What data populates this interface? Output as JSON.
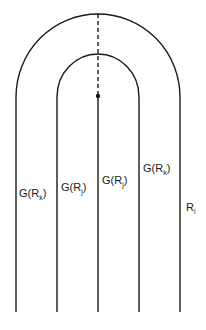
{
  "diagram": {
    "labels": [
      {
        "id": "label-g-rk-left",
        "main": "G(R",
        "sub": "k",
        "close": ")"
      },
      {
        "id": "label-g-rj-left",
        "main": "G(R",
        "sub": "j",
        "close": ")"
      },
      {
        "id": "label-g-rj-right",
        "main": "G(R",
        "sub": "j",
        "close": ")"
      },
      {
        "id": "label-g-rk-right",
        "main": "G(R",
        "sub": "k",
        "close": ")"
      },
      {
        "id": "label-ri",
        "main": "R",
        "sub": "i",
        "close": ""
      }
    ],
    "colors": {
      "stroke": "#1a1a1a",
      "background": "#ffffff"
    }
  }
}
